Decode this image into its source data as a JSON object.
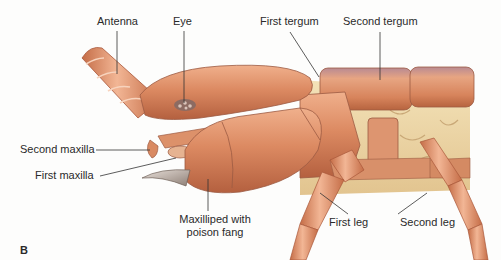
{
  "figure": {
    "panel_letter": "B",
    "colors": {
      "body": "#d9875f",
      "body_highlight": "#f3c0a2",
      "body_shadow": "#a9573a",
      "membrane": "#efd9a8",
      "fang": "#b9aea6",
      "leader_line": "#333333",
      "label_text": "#2a2a2a"
    },
    "labels": {
      "antenna": "Antenna",
      "eye": "Eye",
      "first_tergum": "First tergum",
      "second_tergum": "Second tergum",
      "second_maxilla": "Second maxilla",
      "first_maxilla": "First maxilla",
      "maxilliped_line1": "Maxilliped with",
      "maxilliped_line2": "poison fang",
      "first_leg": "First leg",
      "second_leg": "Second leg"
    }
  }
}
